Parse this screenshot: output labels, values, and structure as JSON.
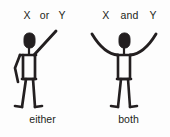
{
  "diagram": {
    "title_or": {
      "var_left": "X",
      "operator": "or",
      "var_right": "Y"
    },
    "title_and": {
      "var_left": "X",
      "operator": "and",
      "var_right": "Y"
    },
    "caption_or": "either",
    "caption_and": "both",
    "colors": {
      "ink": "#231f20",
      "background": "#fdfdfd"
    },
    "figures": {
      "or": {
        "pose": "one-arm-raised",
        "description": "stick figure with right arm raised diagonally upward and left arm hanging down"
      },
      "and": {
        "pose": "both-arms-raised",
        "description": "stick figure with both arms raised upward and outward in a V shape"
      }
    }
  }
}
